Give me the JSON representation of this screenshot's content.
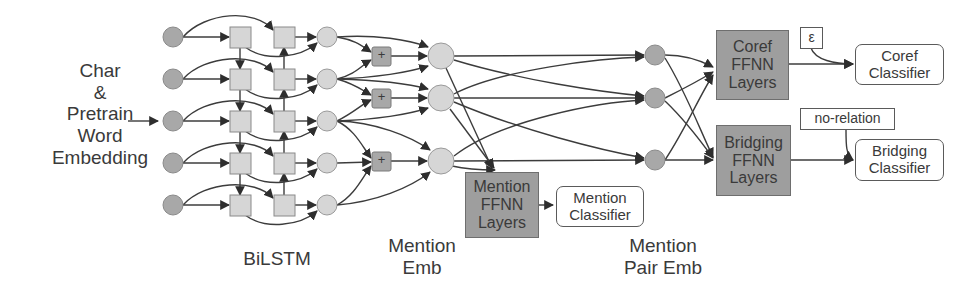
{
  "diagram": {
    "input_label": "Char\n&\nPretrain\nWord\nEmbedding",
    "stage_labels": {
      "bilstm": "BiLSTM",
      "mention_emb": "Mention\nEmb",
      "mention_pair_emb": "Mention\nPair Emb"
    },
    "plus_symbol": "+",
    "mention_ffnn": "Mention\nFFNN\nLayers",
    "mention_classifier": "Mention\nClassifier",
    "coref_ffnn": "Coref\nFFNN\nLayers",
    "bridging_ffnn": "Bridging\nFFNN\nLayers",
    "coref_classifier": "Coref\nClassifier",
    "bridging_classifier": "Bridging\nClassifier",
    "epsilon_tag": "ε",
    "no_relation_tag": "no-relation",
    "colors": {
      "node_light": "#d6d6d6",
      "node_dark": "#a8a8a8",
      "ffnn_fill": "#9e9e9e",
      "stroke": "#3c3c3c"
    }
  }
}
